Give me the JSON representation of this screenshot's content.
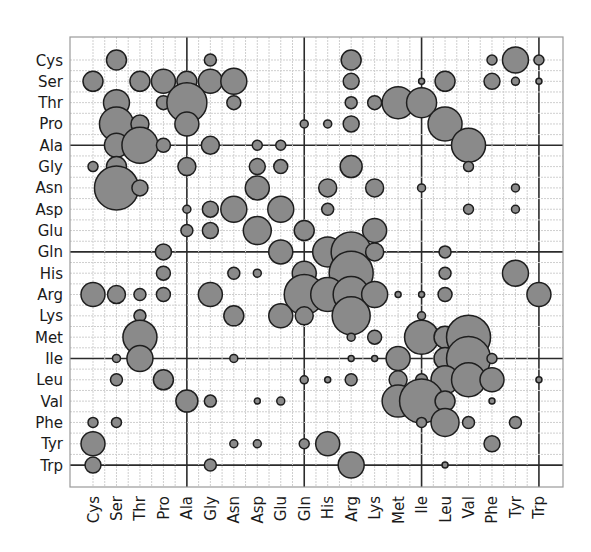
{
  "chart_data": {
    "type": "bubble",
    "title": "",
    "xlabel": "",
    "ylabel": "",
    "grid": true,
    "legend": "none",
    "categories": [
      "Cys",
      "Ser",
      "Thr",
      "Pro",
      "Ala",
      "Gly",
      "Asn",
      "Asp",
      "Glu",
      "Gln",
      "His",
      "Arg",
      "Lys",
      "Met",
      "Ile",
      "Leu",
      "Val",
      "Phe",
      "Tyr",
      "Trp"
    ],
    "x_tick_labels": [
      "Cys",
      "Ser",
      "Thr",
      "Pro",
      "Ala",
      "Gly",
      "Asn",
      "Asp",
      "Glu",
      "Gln",
      "His",
      "Arg",
      "Lys",
      "Met",
      "Ile",
      "Leu",
      "Val",
      "Phe",
      "Tyr",
      "Trp"
    ],
    "y_tick_labels": [
      "Cys",
      "Ser",
      "Thr",
      "Pro",
      "Ala",
      "Gly",
      "Asn",
      "Asp",
      "Glu",
      "Gln",
      "His",
      "Arg",
      "Lys",
      "Met",
      "Ile",
      "Leu",
      "Val",
      "Phe",
      "Tyr",
      "Trp"
    ],
    "major_grid_lines": [
      "Ala",
      "Gln",
      "Ile",
      "Trp"
    ],
    "colors": {
      "bubble_fill": "#8a8a8a",
      "bubble_stroke": "#1e1e1e",
      "major_grid": "#2b2b2b",
      "minor_grid": "#cfcfcf"
    },
    "size_note": "r = approximate bubble radius in pixels (relative magnitude)",
    "points": [
      {
        "row": "Cys",
        "col": "Ser",
        "r": 10
      },
      {
        "row": "Cys",
        "col": "Gly",
        "r": 6
      },
      {
        "row": "Cys",
        "col": "Arg",
        "r": 10
      },
      {
        "row": "Cys",
        "col": "Phe",
        "r": 5
      },
      {
        "row": "Cys",
        "col": "Tyr",
        "r": 13
      },
      {
        "row": "Cys",
        "col": "Trp",
        "r": 5
      },
      {
        "row": "Ser",
        "col": "Cys",
        "r": 10
      },
      {
        "row": "Ser",
        "col": "Thr",
        "r": 10
      },
      {
        "row": "Ser",
        "col": "Pro",
        "r": 12
      },
      {
        "row": "Ser",
        "col": "Ala",
        "r": 10
      },
      {
        "row": "Ser",
        "col": "Gly",
        "r": 12
      },
      {
        "row": "Ser",
        "col": "Asn",
        "r": 13
      },
      {
        "row": "Ser",
        "col": "Arg",
        "r": 8
      },
      {
        "row": "Ser",
        "col": "Ile",
        "r": 3
      },
      {
        "row": "Ser",
        "col": "Leu",
        "r": 10
      },
      {
        "row": "Ser",
        "col": "Phe",
        "r": 8
      },
      {
        "row": "Ser",
        "col": "Tyr",
        "r": 4
      },
      {
        "row": "Ser",
        "col": "Trp",
        "r": 3
      },
      {
        "row": "Thr",
        "col": "Ser",
        "r": 13
      },
      {
        "row": "Thr",
        "col": "Pro",
        "r": 7
      },
      {
        "row": "Thr",
        "col": "Ala",
        "r": 20
      },
      {
        "row": "Thr",
        "col": "Asn",
        "r": 7
      },
      {
        "row": "Thr",
        "col": "Arg",
        "r": 6
      },
      {
        "row": "Thr",
        "col": "Lys",
        "r": 7
      },
      {
        "row": "Thr",
        "col": "Met",
        "r": 16
      },
      {
        "row": "Thr",
        "col": "Ile",
        "r": 15
      },
      {
        "row": "Pro",
        "col": "Ser",
        "r": 17
      },
      {
        "row": "Pro",
        "col": "Thr",
        "r": 9
      },
      {
        "row": "Pro",
        "col": "Ala",
        "r": 12
      },
      {
        "row": "Pro",
        "col": "Gln",
        "r": 4
      },
      {
        "row": "Pro",
        "col": "His",
        "r": 4
      },
      {
        "row": "Pro",
        "col": "Arg",
        "r": 8
      },
      {
        "row": "Pro",
        "col": "Leu",
        "r": 17
      },
      {
        "row": "Ala",
        "col": "Ser",
        "r": 12
      },
      {
        "row": "Ala",
        "col": "Thr",
        "r": 18
      },
      {
        "row": "Ala",
        "col": "Pro",
        "r": 7
      },
      {
        "row": "Ala",
        "col": "Gly",
        "r": 9
      },
      {
        "row": "Ala",
        "col": "Asp",
        "r": 5
      },
      {
        "row": "Ala",
        "col": "Glu",
        "r": 5
      },
      {
        "row": "Ala",
        "col": "Val",
        "r": 17
      },
      {
        "row": "Gly",
        "col": "Cys",
        "r": 5
      },
      {
        "row": "Gly",
        "col": "Ser",
        "r": 10
      },
      {
        "row": "Gly",
        "col": "Ala",
        "r": 9
      },
      {
        "row": "Gly",
        "col": "Asp",
        "r": 8
      },
      {
        "row": "Gly",
        "col": "Glu",
        "r": 7
      },
      {
        "row": "Gly",
        "col": "Arg",
        "r": 11
      },
      {
        "row": "Gly",
        "col": "Val",
        "r": 5
      },
      {
        "row": "Asn",
        "col": "Ser",
        "r": 22
      },
      {
        "row": "Asn",
        "col": "Thr",
        "r": 8
      },
      {
        "row": "Asn",
        "col": "Asp",
        "r": 12
      },
      {
        "row": "Asn",
        "col": "His",
        "r": 9
      },
      {
        "row": "Asn",
        "col": "Lys",
        "r": 9
      },
      {
        "row": "Asn",
        "col": "Ile",
        "r": 4
      },
      {
        "row": "Asn",
        "col": "Tyr",
        "r": 4
      },
      {
        "row": "Asp",
        "col": "Ala",
        "r": 4
      },
      {
        "row": "Asp",
        "col": "Gly",
        "r": 8
      },
      {
        "row": "Asp",
        "col": "Asn",
        "r": 13
      },
      {
        "row": "Asp",
        "col": "Glu",
        "r": 13
      },
      {
        "row": "Asp",
        "col": "His",
        "r": 6
      },
      {
        "row": "Asp",
        "col": "Val",
        "r": 5
      },
      {
        "row": "Asp",
        "col": "Tyr",
        "r": 4
      },
      {
        "row": "Glu",
        "col": "Ala",
        "r": 6
      },
      {
        "row": "Glu",
        "col": "Gly",
        "r": 8
      },
      {
        "row": "Glu",
        "col": "Asp",
        "r": 14
      },
      {
        "row": "Glu",
        "col": "Gln",
        "r": 10
      },
      {
        "row": "Glu",
        "col": "Lys",
        "r": 12
      },
      {
        "row": "Gln",
        "col": "Pro",
        "r": 8
      },
      {
        "row": "Gln",
        "col": "Glu",
        "r": 12
      },
      {
        "row": "Gln",
        "col": "His",
        "r": 15
      },
      {
        "row": "Gln",
        "col": "Arg",
        "r": 20
      },
      {
        "row": "Gln",
        "col": "Lys",
        "r": 9
      },
      {
        "row": "Gln",
        "col": "Leu",
        "r": 6
      },
      {
        "row": "His",
        "col": "Pro",
        "r": 7
      },
      {
        "row": "His",
        "col": "Asn",
        "r": 6
      },
      {
        "row": "His",
        "col": "Asp",
        "r": 4
      },
      {
        "row": "His",
        "col": "Gln",
        "r": 12
      },
      {
        "row": "His",
        "col": "Arg",
        "r": 22
      },
      {
        "row": "His",
        "col": "Leu",
        "r": 6
      },
      {
        "row": "His",
        "col": "Tyr",
        "r": 13
      },
      {
        "row": "Arg",
        "col": "Cys",
        "r": 12
      },
      {
        "row": "Arg",
        "col": "Ser",
        "r": 9
      },
      {
        "row": "Arg",
        "col": "Thr",
        "r": 6
      },
      {
        "row": "Arg",
        "col": "Pro",
        "r": 7
      },
      {
        "row": "Arg",
        "col": "Gly",
        "r": 12
      },
      {
        "row": "Arg",
        "col": "Gln",
        "r": 20
      },
      {
        "row": "Arg",
        "col": "His",
        "r": 17
      },
      {
        "row": "Arg",
        "col": "Arg",
        "r": 18
      },
      {
        "row": "Arg",
        "col": "Lys",
        "r": 13
      },
      {
        "row": "Arg",
        "col": "Met",
        "r": 3
      },
      {
        "row": "Arg",
        "col": "Ile",
        "r": 3
      },
      {
        "row": "Arg",
        "col": "Leu",
        "r": 7
      },
      {
        "row": "Arg",
        "col": "Trp",
        "r": 12
      },
      {
        "row": "Lys",
        "col": "Thr",
        "r": 6
      },
      {
        "row": "Lys",
        "col": "Asn",
        "r": 10
      },
      {
        "row": "Lys",
        "col": "Glu",
        "r": 12
      },
      {
        "row": "Lys",
        "col": "Gln",
        "r": 9
      },
      {
        "row": "Lys",
        "col": "Arg",
        "r": 19
      },
      {
        "row": "Lys",
        "col": "Ile",
        "r": 4
      },
      {
        "row": "Met",
        "col": "Thr",
        "r": 17
      },
      {
        "row": "Met",
        "col": "Arg",
        "r": 4
      },
      {
        "row": "Met",
        "col": "Lys",
        "r": 7
      },
      {
        "row": "Met",
        "col": "Ile",
        "r": 17
      },
      {
        "row": "Met",
        "col": "Leu",
        "r": 11
      },
      {
        "row": "Met",
        "col": "Val",
        "r": 22
      },
      {
        "row": "Ile",
        "col": "Ser",
        "r": 4
      },
      {
        "row": "Ile",
        "col": "Thr",
        "r": 13
      },
      {
        "row": "Ile",
        "col": "Asn",
        "r": 4
      },
      {
        "row": "Ile",
        "col": "Arg",
        "r": 3
      },
      {
        "row": "Ile",
        "col": "Lys",
        "r": 3
      },
      {
        "row": "Ile",
        "col": "Met",
        "r": 12
      },
      {
        "row": "Ile",
        "col": "Leu",
        "r": 11
      },
      {
        "row": "Ile",
        "col": "Val",
        "r": 22
      },
      {
        "row": "Ile",
        "col": "Phe",
        "r": 5
      },
      {
        "row": "Leu",
        "col": "Ser",
        "r": 6
      },
      {
        "row": "Leu",
        "col": "Pro",
        "r": 10
      },
      {
        "row": "Leu",
        "col": "Gln",
        "r": 4
      },
      {
        "row": "Leu",
        "col": "His",
        "r": 3
      },
      {
        "row": "Leu",
        "col": "Arg",
        "r": 6
      },
      {
        "row": "Leu",
        "col": "Met",
        "r": 9
      },
      {
        "row": "Leu",
        "col": "Ile",
        "r": 6
      },
      {
        "row": "Leu",
        "col": "Leu",
        "r": 14
      },
      {
        "row": "Leu",
        "col": "Val",
        "r": 17
      },
      {
        "row": "Leu",
        "col": "Phe",
        "r": 12
      },
      {
        "row": "Leu",
        "col": "Trp",
        "r": 3
      },
      {
        "row": "Val",
        "col": "Ala",
        "r": 11
      },
      {
        "row": "Val",
        "col": "Gly",
        "r": 6
      },
      {
        "row": "Val",
        "col": "Asp",
        "r": 3
      },
      {
        "row": "Val",
        "col": "Glu",
        "r": 4
      },
      {
        "row": "Val",
        "col": "Met",
        "r": 16
      },
      {
        "row": "Val",
        "col": "Ile",
        "r": 22
      },
      {
        "row": "Val",
        "col": "Leu",
        "r": 10
      },
      {
        "row": "Val",
        "col": "Phe",
        "r": 3
      },
      {
        "row": "Phe",
        "col": "Cys",
        "r": 5
      },
      {
        "row": "Phe",
        "col": "Ser",
        "r": 5
      },
      {
        "row": "Phe",
        "col": "Ile",
        "r": 5
      },
      {
        "row": "Phe",
        "col": "Leu",
        "r": 14
      },
      {
        "row": "Phe",
        "col": "Val",
        "r": 6
      },
      {
        "row": "Phe",
        "col": "Tyr",
        "r": 6
      },
      {
        "row": "Tyr",
        "col": "Cys",
        "r": 12
      },
      {
        "row": "Tyr",
        "col": "Asn",
        "r": 4
      },
      {
        "row": "Tyr",
        "col": "Asp",
        "r": 4
      },
      {
        "row": "Tyr",
        "col": "Gln",
        "r": 5
      },
      {
        "row": "Tyr",
        "col": "His",
        "r": 12
      },
      {
        "row": "Tyr",
        "col": "Phe",
        "r": 8
      },
      {
        "row": "Trp",
        "col": "Cys",
        "r": 8
      },
      {
        "row": "Trp",
        "col": "Gly",
        "r": 6
      },
      {
        "row": "Trp",
        "col": "Arg",
        "r": 13
      },
      {
        "row": "Trp",
        "col": "Leu",
        "r": 3
      }
    ]
  }
}
